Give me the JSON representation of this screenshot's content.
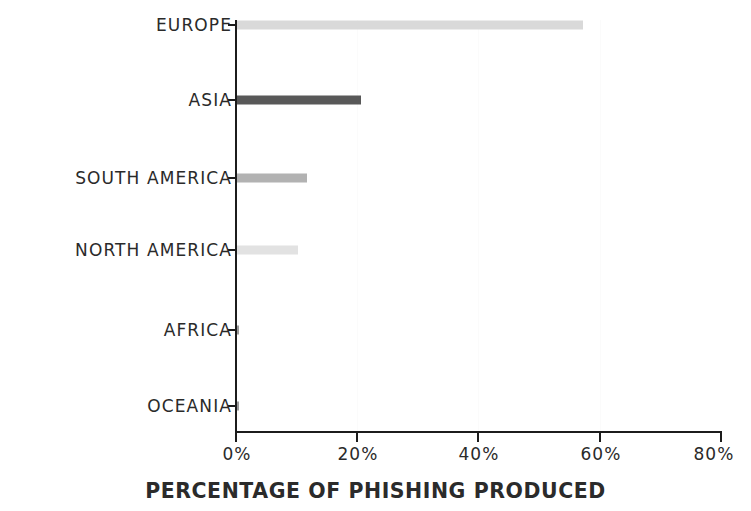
{
  "chart_data": {
    "type": "bar",
    "orientation": "horizontal",
    "title": "",
    "subtitle": "",
    "xlabel": "PERCENTAGE OF PHISHING PRODUCED",
    "ylabel": "",
    "categories": [
      "EUROPE",
      "ASIA",
      "SOUTH AMERICA",
      "NORTH AMERICA",
      "AFRICA",
      "OCEANIA"
    ],
    "values": [
      57,
      20.5,
      11.5,
      10,
      0.3,
      0.2
    ],
    "xlim": [
      0,
      80
    ],
    "ylim": null,
    "xticks": [
      0,
      20,
      40,
      60,
      80
    ],
    "xtick_labels": [
      "0%",
      "20%",
      "40%",
      "60%",
      "80%"
    ],
    "grid": false,
    "legend": null,
    "bar_colors": [
      "#d9d9d9",
      "#585858",
      "#b2b2b2",
      "#e2e2e2",
      "#9a9a9a",
      "#9a9a9a"
    ],
    "axis_color": "#1c1c1c",
    "background_color": "#ffffff",
    "bars": [
      {
        "category": "EUROPE",
        "value": 57,
        "label": "57%",
        "color": "#d9d9d9"
      },
      {
        "category": "ASIA",
        "value": 20.5,
        "label": "20.5%",
        "color": "#585858"
      },
      {
        "category": "SOUTH AMERICA",
        "value": 11.5,
        "label": "11.5%",
        "color": "#b2b2b2"
      },
      {
        "category": "NORTH AMERICA",
        "value": 10,
        "label": "10%",
        "color": "#e2e2e2"
      },
      {
        "category": "AFRICA",
        "value": 0.3,
        "label": "0.3%",
        "color": "#9a9a9a"
      },
      {
        "category": "OCEANIA",
        "value": 0.2,
        "label": "0.2%",
        "color": "#9a9a9a"
      }
    ]
  }
}
